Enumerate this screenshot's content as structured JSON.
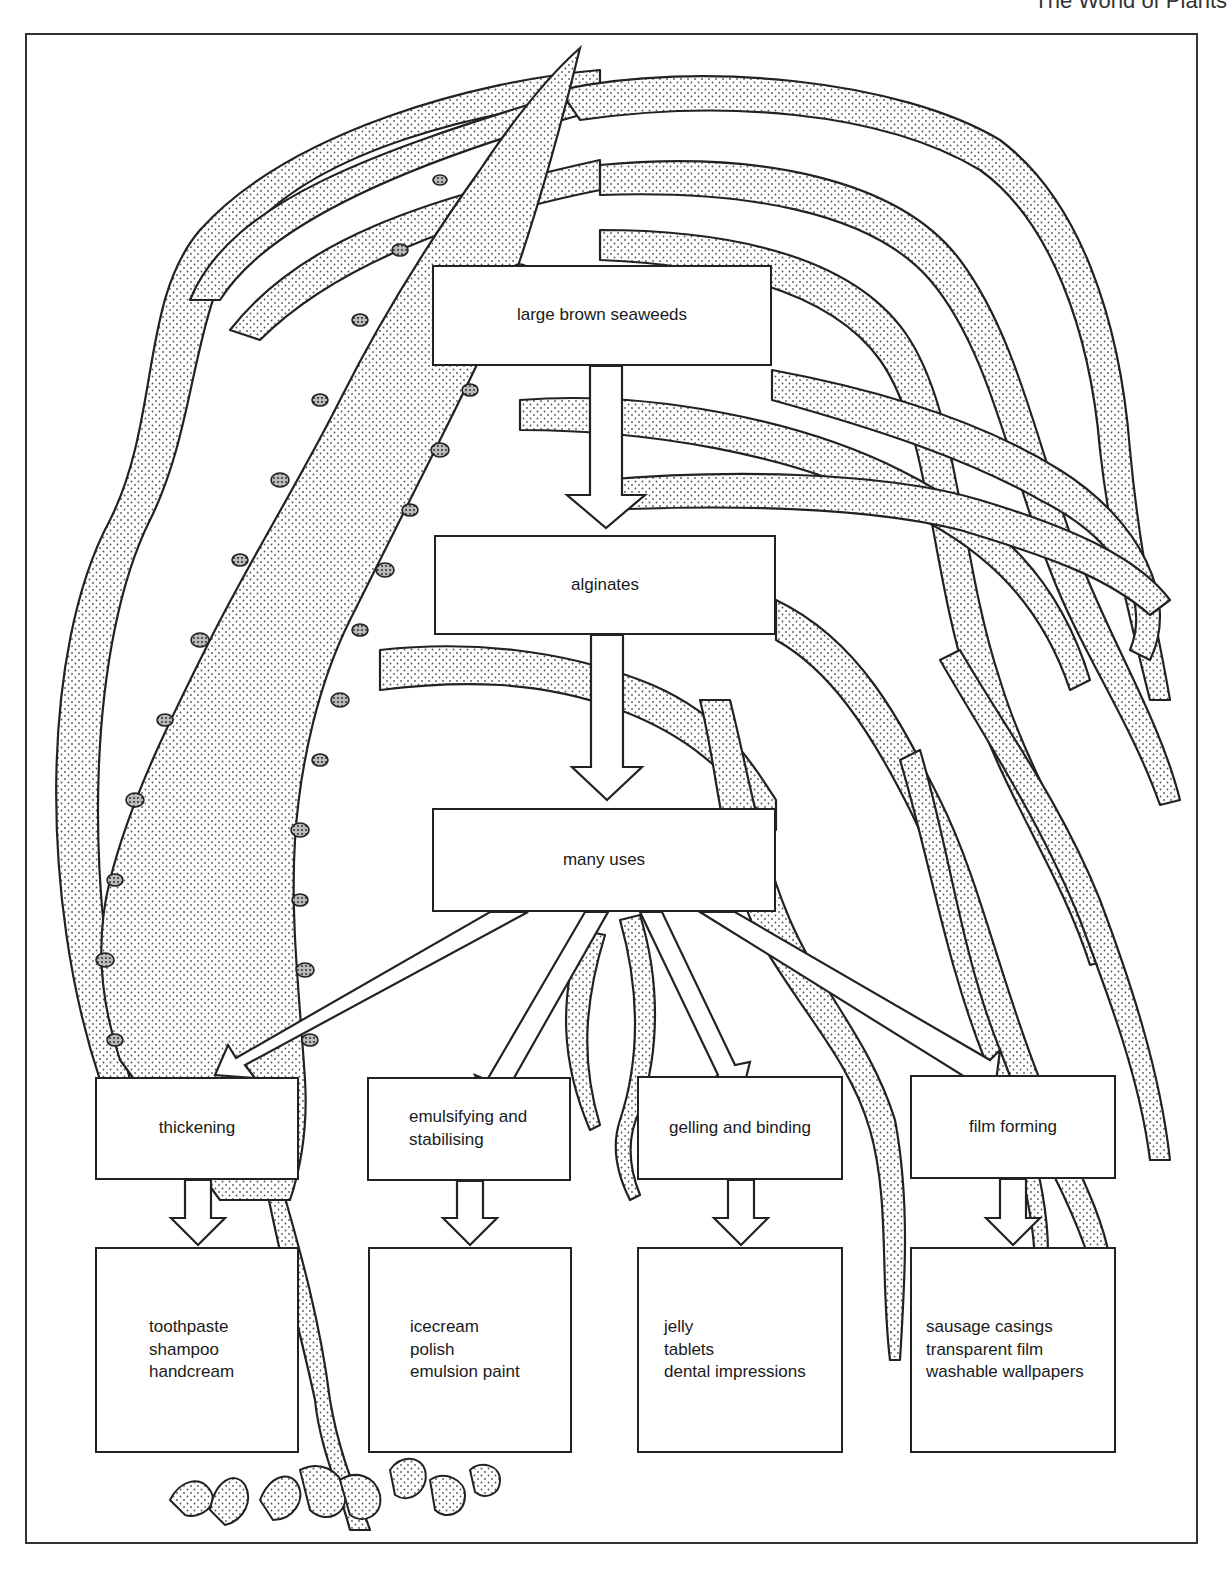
{
  "header": {
    "running_title": "The World of Plants"
  },
  "diagram": {
    "source": {
      "label": "large brown seaweeds"
    },
    "product": {
      "label": "alginates"
    },
    "hub": {
      "label": "many uses"
    },
    "properties": [
      {
        "label_lines": [
          "thickening"
        ],
        "examples": [
          "toothpaste",
          "shampoo",
          "handcream"
        ]
      },
      {
        "label_lines": [
          "emulsifying and",
          "stabilising"
        ],
        "examples": [
          "icecream",
          "polish",
          "emulsion paint"
        ]
      },
      {
        "label_lines": [
          "gelling and binding"
        ],
        "examples": [
          "jelly",
          "tablets",
          "dental impressions"
        ]
      },
      {
        "label_lines": [
          "film forming"
        ],
        "examples": [
          "sausage casings",
          "transparent film",
          "washable wallpapers"
        ]
      }
    ],
    "flow": [
      [
        "large brown seaweeds",
        "alginates"
      ],
      [
        "alginates",
        "many uses"
      ],
      [
        "many uses",
        "thickening"
      ],
      [
        "many uses",
        "emulsifying and stabilising"
      ],
      [
        "many uses",
        "gelling and binding"
      ],
      [
        "many uses",
        "film forming"
      ],
      [
        "thickening",
        "toothpaste / shampoo / handcream"
      ],
      [
        "emulsifying and stabilising",
        "icecream / polish / emulsion paint"
      ],
      [
        "gelling and binding",
        "jelly / tablets / dental impressions"
      ],
      [
        "film forming",
        "sausage casings / transparent film / washable wallpapers"
      ]
    ],
    "background_illustration": "stippled kelp fronds and holdfast"
  }
}
